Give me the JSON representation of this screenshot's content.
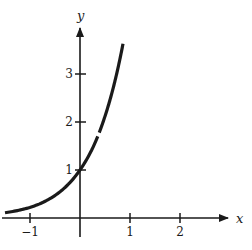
{
  "chart_data": {
    "type": "line",
    "title": "",
    "xlabel": "x",
    "ylabel": "y",
    "xlim": [
      -1.5,
      2.9
    ],
    "ylim": [
      -0.35,
      4.1
    ],
    "grid": false,
    "x_ticks": [
      {
        "value": -1,
        "label": "−1"
      },
      {
        "value": 1,
        "label": "1"
      },
      {
        "value": 2,
        "label": "2"
      }
    ],
    "y_ticks": [
      {
        "value": 1,
        "label": "1"
      },
      {
        "value": 2,
        "label": "2"
      },
      {
        "value": 3,
        "label": "3"
      }
    ],
    "series": [
      {
        "name": "exponential curve",
        "x": [
          -1.5,
          -1.0,
          -0.5,
          0.0,
          0.25,
          0.5,
          0.75,
          0.86
        ],
        "y": [
          0.11,
          0.22,
          0.47,
          1.0,
          1.45,
          2.12,
          3.08,
          3.63
        ]
      }
    ],
    "color": "#1a1a1a"
  }
}
